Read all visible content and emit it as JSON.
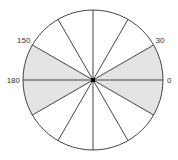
{
  "diagram": {
    "type": "circle-sector-diagram",
    "center": {
      "x": 93,
      "y": 80
    },
    "radius": 70,
    "sector_step_degrees": 30,
    "radial_line_angles": [
      0,
      30,
      60,
      90,
      120,
      150,
      180,
      210,
      240,
      270,
      300,
      330
    ],
    "shaded_sectors": [
      {
        "from": 0,
        "to": 30
      },
      {
        "from": 150,
        "to": 180
      },
      {
        "from": 180,
        "to": 210
      },
      {
        "from": 330,
        "to": 360
      }
    ],
    "labels": [
      {
        "text": "0",
        "angle": 0
      },
      {
        "text": "30",
        "angle": 30
      },
      {
        "text": "150",
        "angle": 150
      },
      {
        "text": "180",
        "angle": 180
      }
    ],
    "colors": {
      "shade": "#e4e4e4",
      "line": "#444444",
      "center_dot": "#000000"
    }
  }
}
